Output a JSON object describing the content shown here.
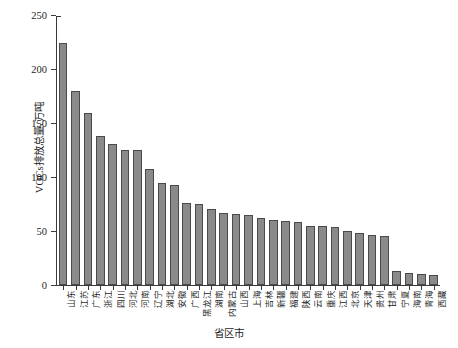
{
  "chart_data": {
    "type": "bar",
    "title": "",
    "xlabel": "省区市",
    "ylabel": "VOCs排放总量/万吨",
    "ylim": [
      0,
      250
    ],
    "yticks": [
      0,
      50,
      100,
      150,
      200,
      250
    ],
    "ytick_labels": [
      "0",
      "50",
      "100",
      "150",
      "200",
      "250"
    ],
    "grid": false,
    "legend": "none",
    "bar_color": "#8a8a8a",
    "bar_edge_color": "#4a4a4a",
    "axis_color": "#3a3a3a",
    "categories": [
      "山东",
      "江苏",
      "广东",
      "浙江",
      "四川",
      "河北",
      "河南",
      "辽宁",
      "湖北",
      "安徽",
      "广西",
      "黑龙江",
      "湖南",
      "内蒙古",
      "山西",
      "上海",
      "吉林",
      "新疆",
      "福建",
      "陕西",
      "云南",
      "重庆",
      "江西",
      "北京",
      "天津",
      "贵州",
      "甘肃",
      "宁夏",
      "海南",
      "青海",
      "西藏"
    ],
    "values": [
      224,
      180,
      159,
      138,
      131,
      125,
      125,
      107,
      94,
      93,
      76,
      75,
      70,
      67,
      66,
      65,
      62,
      60,
      59,
      58,
      55,
      55,
      54,
      50,
      48,
      46,
      45,
      13,
      11,
      10,
      9
    ]
  }
}
